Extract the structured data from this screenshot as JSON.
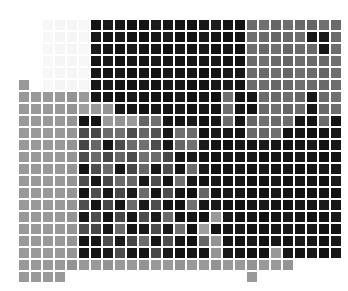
{
  "figure": {
    "title": "",
    "background_color": "#ffffff",
    "width": 348,
    "height": 291
  },
  "top_strip": {
    "ghost_marks": [
      "——",
      "··",
      "··",
      "··"
    ]
  },
  "heatmap": {
    "cell_size": 12,
    "origin_x": 6,
    "origin_y": 19,
    "gap_color": "#ffffff",
    "colormap": "grayscale",
    "vmin": 0,
    "vmax": 1
  },
  "chart_data": {
    "type": "heatmap",
    "title": "",
    "xlabel": "",
    "ylabel": "",
    "xticklabels": [],
    "yticklabels": [],
    "grid": false,
    "legend": "none",
    "colormap": "gray_r",
    "vmin": 0.0,
    "vmax": 1.0,
    "nrows": 22,
    "ncols": 28,
    "values": [
      [
        1.0,
        1.0,
        1.0,
        0.97,
        0.96,
        0.96,
        0.97,
        0.08,
        0.1,
        0.09,
        0.07,
        0.08,
        0.1,
        0.09,
        0.08,
        0.07,
        0.09,
        0.11,
        0.08,
        0.07,
        0.42,
        0.44,
        0.4,
        0.43,
        0.41,
        0.4,
        0.44,
        0.42
      ],
      [
        1.0,
        1.0,
        1.0,
        0.97,
        0.96,
        0.96,
        0.97,
        0.09,
        0.08,
        0.1,
        0.08,
        0.07,
        0.09,
        0.11,
        0.07,
        0.08,
        0.1,
        0.09,
        0.07,
        0.08,
        0.44,
        0.42,
        0.4,
        0.41,
        0.43,
        0.09,
        0.1,
        0.42
      ],
      [
        1.0,
        1.0,
        1.0,
        0.97,
        0.96,
        0.96,
        0.97,
        0.1,
        0.09,
        0.08,
        0.1,
        0.08,
        0.09,
        0.07,
        0.09,
        0.08,
        0.1,
        0.08,
        0.09,
        0.07,
        0.43,
        0.41,
        0.44,
        0.4,
        0.42,
        0.41,
        0.09,
        0.43
      ],
      [
        1.0,
        1.0,
        1.0,
        0.97,
        0.96,
        0.96,
        0.97,
        0.08,
        0.1,
        0.07,
        0.09,
        0.08,
        0.1,
        0.09,
        0.07,
        0.08,
        0.09,
        0.1,
        0.08,
        0.07,
        0.42,
        0.44,
        0.41,
        0.4,
        0.43,
        0.42,
        0.41,
        0.44
      ],
      [
        1.0,
        1.0,
        1.0,
        0.97,
        0.96,
        0.96,
        0.97,
        0.09,
        0.08,
        0.1,
        0.08,
        0.09,
        0.07,
        0.1,
        0.08,
        0.09,
        0.07,
        0.08,
        0.1,
        0.09,
        0.42,
        0.41,
        0.43,
        0.4,
        0.44,
        0.42,
        0.4,
        0.43
      ],
      [
        1.0,
        0.6,
        1.0,
        0.97,
        0.96,
        0.96,
        0.97,
        0.09,
        0.1,
        0.08,
        0.07,
        0.09,
        0.08,
        0.1,
        0.09,
        0.07,
        0.08,
        0.09,
        0.1,
        0.08,
        0.42,
        0.43,
        0.4,
        0.41,
        0.44,
        0.42,
        0.41,
        0.43
      ],
      [
        1.0,
        0.6,
        0.6,
        0.6,
        0.6,
        0.58,
        0.6,
        0.09,
        0.08,
        0.07,
        0.1,
        0.08,
        0.09,
        0.07,
        0.1,
        0.08,
        0.09,
        0.07,
        0.44,
        0.08,
        0.09,
        0.42,
        0.41,
        0.43,
        0.4,
        0.09,
        0.42,
        0.44
      ],
      [
        1.0,
        0.6,
        0.6,
        0.6,
        0.6,
        0.58,
        0.62,
        0.6,
        0.58,
        0.1,
        0.08,
        0.07,
        0.09,
        0.08,
        0.1,
        0.07,
        0.09,
        0.08,
        0.43,
        0.09,
        0.07,
        0.41,
        0.44,
        0.4,
        0.42,
        0.09,
        0.41,
        0.43
      ],
      [
        1.0,
        0.6,
        0.6,
        0.6,
        0.6,
        0.58,
        0.08,
        0.07,
        0.6,
        0.58,
        0.6,
        0.4,
        0.44,
        0.09,
        0.08,
        0.1,
        0.07,
        0.09,
        0.42,
        0.08,
        0.4,
        0.44,
        0.41,
        0.43,
        0.09,
        0.08,
        0.42,
        0.08
      ],
      [
        1.0,
        0.6,
        0.6,
        0.6,
        0.6,
        0.58,
        0.3,
        0.28,
        0.42,
        0.44,
        0.3,
        0.4,
        0.32,
        0.09,
        0.44,
        0.42,
        0.08,
        0.1,
        0.09,
        0.07,
        0.41,
        0.4,
        0.44,
        0.08,
        0.09,
        0.07,
        0.08,
        0.09
      ],
      [
        1.0,
        0.6,
        0.6,
        0.6,
        0.6,
        0.58,
        0.28,
        0.4,
        0.08,
        0.3,
        0.42,
        0.44,
        0.3,
        0.09,
        0.4,
        0.44,
        0.1,
        0.08,
        0.07,
        0.09,
        0.08,
        0.1,
        0.09,
        0.07,
        0.08,
        0.1,
        0.07,
        0.09
      ],
      [
        1.0,
        0.6,
        0.6,
        0.6,
        0.6,
        0.58,
        0.3,
        0.42,
        0.28,
        0.4,
        0.3,
        0.44,
        0.42,
        0.28,
        0.09,
        0.1,
        0.08,
        0.07,
        0.09,
        0.08,
        0.1,
        0.07,
        0.09,
        0.08,
        0.1,
        0.09,
        0.07,
        0.08
      ],
      [
        1.0,
        0.6,
        0.6,
        0.6,
        0.6,
        0.58,
        0.07,
        0.3,
        0.42,
        0.09,
        0.28,
        0.4,
        0.09,
        0.3,
        0.08,
        0.42,
        0.1,
        0.07,
        0.08,
        0.09,
        0.07,
        0.1,
        0.08,
        0.09,
        0.07,
        0.08,
        0.1,
        0.09
      ],
      [
        1.0,
        0.6,
        0.6,
        0.6,
        0.6,
        0.58,
        0.3,
        0.09,
        0.28,
        0.42,
        0.4,
        0.09,
        0.3,
        0.08,
        0.44,
        0.09,
        0.07,
        0.1,
        0.08,
        0.09,
        0.07,
        0.08,
        0.1,
        0.07,
        0.09,
        0.08,
        0.07,
        0.1
      ],
      [
        1.0,
        0.6,
        0.6,
        0.6,
        0.6,
        0.58,
        0.08,
        0.3,
        0.09,
        0.28,
        0.1,
        0.42,
        0.08,
        0.3,
        0.09,
        0.07,
        0.4,
        0.08,
        0.1,
        0.09,
        0.07,
        0.08,
        0.1,
        0.09,
        0.07,
        0.08,
        0.09,
        0.07
      ],
      [
        1.0,
        0.6,
        0.6,
        0.6,
        0.6,
        0.58,
        0.3,
        0.08,
        0.28,
        0.09,
        0.42,
        0.1,
        0.3,
        0.08,
        0.07,
        0.44,
        0.09,
        0.1,
        0.08,
        0.07,
        0.09,
        0.1,
        0.08,
        0.07,
        0.09,
        0.08,
        0.1,
        0.09
      ],
      [
        1.0,
        0.6,
        0.6,
        0.6,
        0.6,
        0.58,
        0.09,
        0.3,
        0.08,
        0.28,
        0.09,
        0.3,
        0.1,
        0.42,
        0.08,
        0.09,
        0.07,
        0.6,
        0.1,
        0.08,
        0.09,
        0.07,
        0.08,
        0.1,
        0.09,
        0.07,
        0.08,
        0.1
      ],
      [
        1.0,
        0.6,
        0.6,
        0.6,
        0.6,
        0.58,
        0.3,
        0.28,
        0.09,
        0.42,
        0.08,
        0.09,
        0.3,
        0.1,
        0.44,
        0.07,
        0.62,
        0.08,
        0.09,
        0.1,
        0.07,
        0.08,
        0.09,
        0.1,
        0.08,
        0.09,
        0.07,
        0.08
      ],
      [
        1.0,
        0.6,
        0.6,
        0.6,
        0.6,
        0.58,
        0.08,
        0.09,
        0.3,
        0.1,
        0.28,
        0.42,
        0.08,
        0.3,
        0.09,
        0.07,
        0.4,
        0.58,
        0.09,
        0.08,
        0.1,
        0.07,
        0.09,
        0.08,
        0.1,
        0.09,
        0.07,
        0.1
      ],
      [
        1.0,
        0.6,
        0.6,
        0.6,
        0.6,
        0.58,
        0.09,
        0.08,
        0.1,
        0.3,
        0.09,
        0.08,
        0.28,
        0.1,
        0.07,
        0.09,
        0.08,
        0.58,
        0.1,
        0.09,
        0.07,
        0.08,
        0.6,
        0.09,
        0.08,
        0.1,
        0.07,
        0.09
      ],
      [
        1.0,
        0.6,
        0.6,
        0.6,
        0.6,
        0.58,
        0.6,
        0.6,
        0.58,
        0.6,
        0.6,
        0.58,
        0.6,
        0.6,
        0.58,
        0.6,
        0.6,
        0.58,
        0.6,
        0.6,
        0.58,
        0.6,
        0.6,
        0.58,
        1.0,
        1.0,
        1.0,
        1.0
      ],
      [
        1.0,
        0.6,
        0.6,
        0.6,
        0.6,
        1.0,
        1.0,
        1.0,
        1.0,
        1.0,
        1.0,
        1.0,
        1.0,
        1.0,
        1.0,
        1.0,
        1.0,
        1.0,
        1.0,
        1.0,
        0.6,
        1.0,
        1.0,
        1.0,
        1.0,
        1.0,
        1.0,
        1.0
      ]
    ]
  }
}
